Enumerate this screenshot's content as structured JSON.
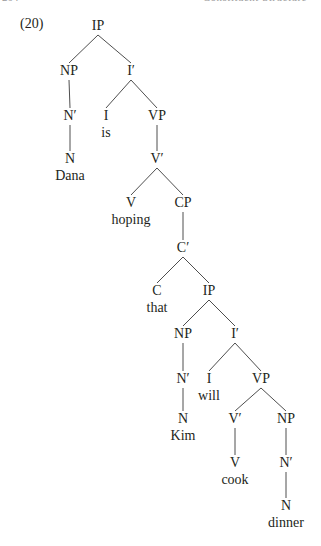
{
  "running_head": {
    "page_number": "204",
    "title": "Constituent Structure"
  },
  "example_number": "(20)",
  "tree": {
    "nodes": [
      {
        "id": "ip1",
        "label": "IP",
        "x": 98,
        "y": 17
      },
      {
        "id": "np1",
        "label": "NP",
        "x": 69,
        "y": 62
      },
      {
        "id": "ibar1",
        "label": "I′",
        "x": 131,
        "y": 62
      },
      {
        "id": "nbar1",
        "label": "N′",
        "x": 70,
        "y": 107
      },
      {
        "id": "i1",
        "label": "I",
        "word": "is",
        "x": 106,
        "y": 107
      },
      {
        "id": "vp1",
        "label": "VP",
        "x": 157,
        "y": 107
      },
      {
        "id": "n1",
        "label": "N",
        "word": "Dana",
        "x": 70,
        "y": 150
      },
      {
        "id": "vbar1",
        "label": "V′",
        "x": 157,
        "y": 150
      },
      {
        "id": "v1",
        "label": "V",
        "word": "hoping",
        "x": 131,
        "y": 194
      },
      {
        "id": "cp1",
        "label": "CP",
        "x": 183,
        "y": 194
      },
      {
        "id": "cbar1",
        "label": "C′",
        "x": 183,
        "y": 239
      },
      {
        "id": "c1",
        "label": "C",
        "word": "that",
        "x": 157,
        "y": 282
      },
      {
        "id": "ip2",
        "label": "IP",
        "x": 209,
        "y": 282
      },
      {
        "id": "np2",
        "label": "NP",
        "x": 183,
        "y": 325
      },
      {
        "id": "ibar2",
        "label": "I′",
        "x": 235,
        "y": 325
      },
      {
        "id": "nbar2",
        "label": "N′",
        "x": 183,
        "y": 370
      },
      {
        "id": "i2",
        "label": "I",
        "word": "will",
        "x": 209,
        "y": 370
      },
      {
        "id": "vp2",
        "label": "VP",
        "x": 261,
        "y": 370
      },
      {
        "id": "n2",
        "label": "N",
        "word": "Kim",
        "x": 183,
        "y": 410
      },
      {
        "id": "vbar2",
        "label": "V′",
        "x": 235,
        "y": 410
      },
      {
        "id": "np3",
        "label": "NP",
        "x": 286,
        "y": 410
      },
      {
        "id": "v2",
        "label": "V",
        "word": "cook",
        "x": 235,
        "y": 454
      },
      {
        "id": "nbar3",
        "label": "N′",
        "x": 286,
        "y": 454
      },
      {
        "id": "n3",
        "label": "N",
        "word": "dinner",
        "x": 286,
        "y": 497
      }
    ],
    "edges": [
      [
        "ip1",
        "np1"
      ],
      [
        "ip1",
        "ibar1"
      ],
      [
        "np1",
        "nbar1"
      ],
      [
        "nbar1",
        "n1"
      ],
      [
        "ibar1",
        "i1"
      ],
      [
        "ibar1",
        "vp1"
      ],
      [
        "vp1",
        "vbar1"
      ],
      [
        "vbar1",
        "v1"
      ],
      [
        "vbar1",
        "cp1"
      ],
      [
        "cp1",
        "cbar1"
      ],
      [
        "cbar1",
        "c1"
      ],
      [
        "cbar1",
        "ip2"
      ],
      [
        "ip2",
        "np2"
      ],
      [
        "ip2",
        "ibar2"
      ],
      [
        "np2",
        "nbar2"
      ],
      [
        "nbar2",
        "n2"
      ],
      [
        "ibar2",
        "i2"
      ],
      [
        "ibar2",
        "vp2"
      ],
      [
        "vp2",
        "vbar2"
      ],
      [
        "vp2",
        "np3"
      ],
      [
        "vbar2",
        "v2"
      ],
      [
        "np3",
        "nbar3"
      ],
      [
        "nbar3",
        "n3"
      ]
    ]
  }
}
